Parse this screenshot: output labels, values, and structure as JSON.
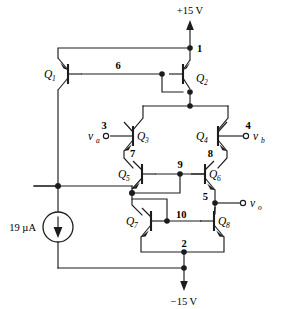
{
  "figure": {
    "type": "transistor-circuit-schematic"
  },
  "rails": {
    "positive": "+15 V",
    "negative": "−15 V"
  },
  "source": {
    "label": "19 µA",
    "direction": "down"
  },
  "signals": {
    "va": "v",
    "va_sub": "a",
    "vb": "v",
    "vb_sub": "b",
    "vo": "v",
    "vo_sub": "o"
  },
  "nodes": [
    {
      "id": "1",
      "label": "1"
    },
    {
      "id": "2",
      "label": "2"
    },
    {
      "id": "3",
      "label": "3"
    },
    {
      "id": "4",
      "label": "4"
    },
    {
      "id": "5",
      "label": "5"
    },
    {
      "id": "6",
      "label": "6"
    },
    {
      "id": "7",
      "label": "7"
    },
    {
      "id": "8",
      "label": "8"
    },
    {
      "id": "9",
      "label": "9"
    },
    {
      "id": "10",
      "label": "10"
    }
  ],
  "transistors": [
    {
      "id": "Q1",
      "name": "Q",
      "sub": "1",
      "type": "pnp"
    },
    {
      "id": "Q2",
      "name": "Q",
      "sub": "2",
      "type": "pnp"
    },
    {
      "id": "Q3",
      "name": "Q",
      "sub": "3",
      "type": "npn"
    },
    {
      "id": "Q4",
      "name": "Q",
      "sub": "4",
      "type": "npn"
    },
    {
      "id": "Q5",
      "name": "Q",
      "sub": "5",
      "type": "npn"
    },
    {
      "id": "Q6",
      "name": "Q",
      "sub": "6",
      "type": "npn"
    },
    {
      "id": "Q7",
      "name": "Q",
      "sub": "7",
      "type": "npn"
    },
    {
      "id": "Q8",
      "name": "Q",
      "sub": "8",
      "type": "npn"
    }
  ],
  "colors": {
    "ink": "#1c1c1c",
    "background": "#ffffff"
  }
}
